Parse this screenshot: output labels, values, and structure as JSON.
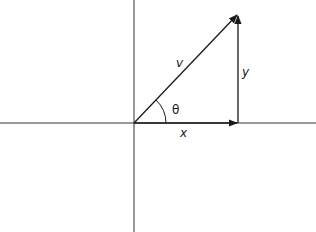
{
  "diagram": {
    "labels": {
      "hypotenuse": "v",
      "vertical": "y",
      "horizontal": "x",
      "angle": "θ"
    },
    "colors": {
      "line": "#1a1a1a",
      "axis": "#333333",
      "background": "#ffffff"
    }
  }
}
